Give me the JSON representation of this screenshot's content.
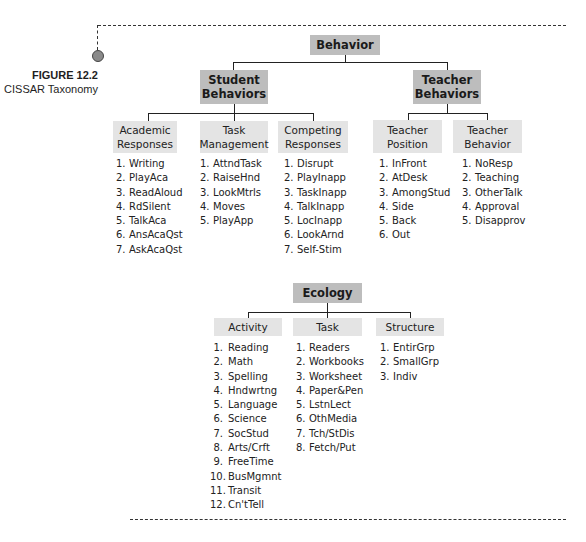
{
  "figure": {
    "number": "FIGURE 12.2",
    "caption": "CISSAR Taxonomy"
  },
  "behavior": {
    "root": "Behavior",
    "student": {
      "label": "Student Behaviors",
      "line1": "Student",
      "line2": "Behaviors",
      "groups": [
        {
          "line1": "Academic",
          "line2": "Responses",
          "items": [
            "Writing",
            "PlayAca",
            "ReadAloud",
            "RdSilent",
            "TalkAca",
            "AnsAcaQst",
            "AskAcaQst"
          ]
        },
        {
          "line1": "Task",
          "line2": "Management",
          "items": [
            "AttndTask",
            "RaiseHnd",
            "LookMtrls",
            "Moves",
            "PlayApp"
          ]
        },
        {
          "line1": "Competing",
          "line2": "Responses",
          "items": [
            "Disrupt",
            "PlayInapp",
            "TaskInapp",
            "TalkInapp",
            "LocInapp",
            "LookArnd",
            "Self-Stim"
          ]
        }
      ]
    },
    "teacher": {
      "label": "Teacher Behaviors",
      "line1": "Teacher",
      "line2": "Behaviors",
      "groups": [
        {
          "line1": "Teacher",
          "line2": "Position",
          "items": [
            "InFront",
            "AtDesk",
            "AmongStud",
            "Side",
            "Back",
            "Out"
          ]
        },
        {
          "line1": "Teacher",
          "line2": "Behavior",
          "items": [
            "NoResp",
            "Teaching",
            "OtherTalk",
            "Approval",
            "Disapprov"
          ]
        }
      ]
    }
  },
  "ecology": {
    "root": "Ecology",
    "groups": [
      {
        "label": "Activity",
        "items": [
          "Reading",
          "Math",
          "Spelling",
          "Hndwrtng",
          "Language",
          "Science",
          "SocStud",
          "Arts/Crft",
          "FreeTime",
          "BusMgmnt",
          "Transit",
          "Cn'tTell"
        ]
      },
      {
        "label": "Task",
        "items": [
          "Readers",
          "Workbooks",
          "Worksheet",
          "Paper&Pen",
          "LstnLect",
          "OthMedia",
          "Tch/StDis",
          "Fetch/Put"
        ]
      },
      {
        "label": "Structure",
        "items": [
          "EntirGrp",
          "SmallGrp",
          "Indiv"
        ]
      }
    ]
  },
  "colors": {
    "dark_box": "#bdbdbd",
    "light_box": "#e4e4e4",
    "marker_circle": "#8a8a8a"
  }
}
